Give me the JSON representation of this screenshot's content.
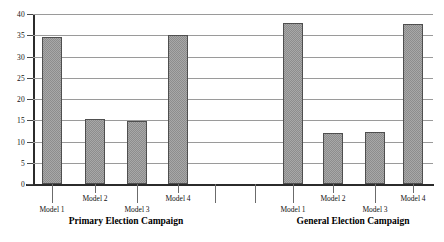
{
  "chart_data": {
    "type": "bar",
    "title": "",
    "xlabel": "",
    "ylabel": "",
    "ylim": [
      0,
      40
    ],
    "ytick_step": 5,
    "yticks": [
      "0",
      "5",
      "10",
      "15",
      "20",
      "25",
      "30",
      "35",
      "40"
    ],
    "grid": true,
    "legend": "none",
    "categories": [
      "Model 1",
      "Model 2",
      "Model 3",
      "Model 4"
    ],
    "groups": [
      {
        "name": "Primary Election Campaign",
        "values": [
          34.5,
          15.4,
          14.9,
          35.0
        ]
      },
      {
        "name": "General Election Campaign",
        "values": [
          38.0,
          12.0,
          12.2,
          37.6
        ]
      }
    ],
    "bar_color": "#a8a8a8",
    "bar_edge_color": "#4f4f4f",
    "gridline_color": "#9a9a9a",
    "axis_color": "#2b2b2b"
  }
}
